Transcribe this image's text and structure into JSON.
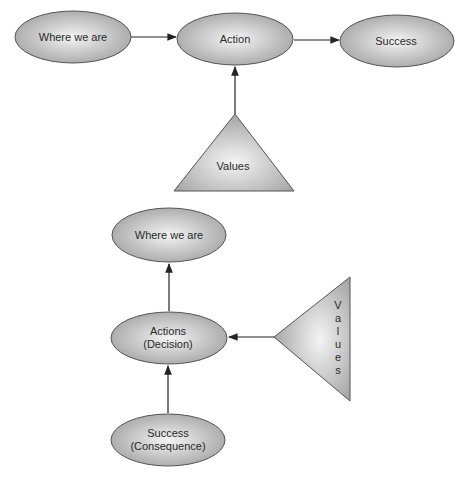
{
  "colors": {
    "shape_center": "#f2f2f2",
    "shape_edge": "#a9a9a9",
    "outline": "#555555",
    "arrow": "#222222",
    "text": "#2a2a2a"
  },
  "diagram_top": {
    "nodes": [
      {
        "id": "where",
        "label": "Where we are"
      },
      {
        "id": "action",
        "label": "Action"
      },
      {
        "id": "success",
        "label": "Success"
      }
    ],
    "values_triangle": {
      "label": "Values"
    },
    "edges": [
      {
        "from": "where",
        "to": "action"
      },
      {
        "from": "action",
        "to": "success"
      },
      {
        "from": "values",
        "to": "action"
      }
    ]
  },
  "diagram_bottom": {
    "nodes": [
      {
        "id": "where",
        "label": "Where we are"
      },
      {
        "id": "actions",
        "line1": "Actions",
        "line2": "(Decision)"
      },
      {
        "id": "success",
        "line1": "Success",
        "line2": "(Consequence)"
      }
    ],
    "values_triangle": {
      "letters": [
        "V",
        "a",
        "l",
        "u",
        "e",
        "s"
      ]
    },
    "edges": [
      {
        "from": "actions",
        "to": "where"
      },
      {
        "from": "success",
        "to": "actions"
      },
      {
        "from": "values",
        "to": "actions"
      }
    ]
  }
}
